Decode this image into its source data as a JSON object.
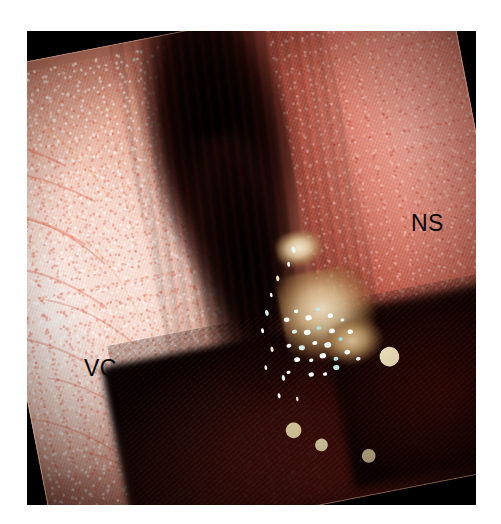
{
  "figure": {
    "type": "endoscopic-photograph",
    "modality": "nasal endoscopy",
    "background_color": "#ffffff",
    "frame_color": "#000000",
    "frame": {
      "x": 27,
      "y": 31,
      "width": 449,
      "height": 474
    },
    "photo_rotation_degrees": -11
  },
  "annotations": [
    {
      "id": "ns",
      "label": "NS",
      "meaning": "nasal septum",
      "color": "#080808",
      "font_size_px": 23,
      "x": 411,
      "y": 212
    },
    {
      "id": "vc",
      "label": "VC",
      "meaning": "vocal cord",
      "color": "#080808",
      "font_size_px": 23,
      "x": 84,
      "y": 357
    }
  ],
  "regions": [
    {
      "name": "pale-mucosa-left",
      "description": "pale pink and white mottled mucosal surface occupying the left half of the field",
      "dominant_colors": [
        "#fdf6f0",
        "#f2cdbd",
        "#d88c74",
        "#e74c36"
      ]
    },
    {
      "name": "pink-mucosa-right",
      "description": "pink-red mucosal wall on the right side of the field",
      "dominant_colors": [
        "#f0ae9e",
        "#d9806c",
        "#b3553f",
        "#8c2f22"
      ]
    },
    {
      "name": "dark-airway-center",
      "description": "dark central passage between the two mucosal walls",
      "dominant_colors": [
        "#000000",
        "#190604",
        "#3c0f0b"
      ]
    },
    {
      "name": "lesion-center-lower",
      "description": "tan and pale-yellow nodular lesion on the lower central wall",
      "dominant_colors": [
        "#f0e2c4",
        "#d6ba8c",
        "#a87c4a"
      ]
    },
    {
      "name": "specular-speckles",
      "description": "cluster of bright white and cyan specular highlights over the lesion",
      "dominant_colors": [
        "#ffffff",
        "#d9f2f2",
        "#8fd4d4"
      ]
    },
    {
      "name": "dark-maroon-inferior",
      "description": "deep maroon shadowed tissue across the lower portion of the field",
      "dominant_colors": [
        "#5c140e",
        "#3a0c09",
        "#180504"
      ]
    }
  ],
  "speckles": {
    "cluster": [
      {
        "x": 14,
        "y": 30,
        "r": 2.1,
        "c": "#ffffff"
      },
      {
        "x": 22,
        "y": 24,
        "r": 1.7,
        "c": "#e6f7f7"
      },
      {
        "x": 30,
        "y": 32,
        "r": 2.4,
        "c": "#ffffff"
      },
      {
        "x": 38,
        "y": 26,
        "r": 1.6,
        "c": "#bfe8e8"
      },
      {
        "x": 46,
        "y": 34,
        "r": 2.0,
        "c": "#ffffff"
      },
      {
        "x": 18,
        "y": 42,
        "r": 1.9,
        "c": "#d6f0f0"
      },
      {
        "x": 27,
        "y": 45,
        "r": 2.5,
        "c": "#ffffff"
      },
      {
        "x": 36,
        "y": 43,
        "r": 1.8,
        "c": "#a8dede"
      },
      {
        "x": 45,
        "y": 48,
        "r": 2.2,
        "c": "#ffffff"
      },
      {
        "x": 54,
        "y": 40,
        "r": 1.5,
        "c": "#e2f5f5"
      },
      {
        "x": 12,
        "y": 54,
        "r": 1.8,
        "c": "#ffffff"
      },
      {
        "x": 21,
        "y": 58,
        "r": 2.3,
        "c": "#cfeeee"
      },
      {
        "x": 31,
        "y": 56,
        "r": 1.9,
        "c": "#ffffff"
      },
      {
        "x": 40,
        "y": 60,
        "r": 2.6,
        "c": "#f2fbfb"
      },
      {
        "x": 50,
        "y": 57,
        "r": 1.7,
        "c": "#9ed8d8"
      },
      {
        "x": 58,
        "y": 52,
        "r": 2.0,
        "c": "#ffffff"
      },
      {
        "x": 16,
        "y": 68,
        "r": 2.2,
        "c": "#ffffff"
      },
      {
        "x": 26,
        "y": 71,
        "r": 1.6,
        "c": "#dff4f4"
      },
      {
        "x": 35,
        "y": 69,
        "r": 2.4,
        "c": "#ffffff"
      },
      {
        "x": 44,
        "y": 74,
        "r": 1.8,
        "c": "#b5e3e3"
      },
      {
        "x": 53,
        "y": 70,
        "r": 2.1,
        "c": "#ffffff"
      },
      {
        "x": 24,
        "y": 84,
        "r": 2.0,
        "c": "#f6fcfc"
      },
      {
        "x": 34,
        "y": 86,
        "r": 1.6,
        "c": "#ffffff"
      },
      {
        "x": 43,
        "y": 82,
        "r": 2.3,
        "c": "#c8eaea"
      },
      {
        "x": 8,
        "y": 78,
        "r": 1.5,
        "c": "#ffffff"
      },
      {
        "x": 60,
        "y": 78,
        "r": 1.7,
        "c": "#eaf8f8"
      }
    ],
    "trail": [
      {
        "x": 62,
        "y": 6,
        "r": 2.0,
        "c": "#e8f6f6"
      },
      {
        "x": 54,
        "y": 14,
        "r": 1.5,
        "c": "#ffffff"
      },
      {
        "x": 40,
        "y": 21,
        "r": 1.7,
        "c": "#f0e4c0"
      },
      {
        "x": 30,
        "y": 30,
        "r": 1.4,
        "c": "#ffffff"
      },
      {
        "x": 22,
        "y": 40,
        "r": 1.8,
        "c": "#dff0f0"
      },
      {
        "x": 14,
        "y": 50,
        "r": 1.5,
        "c": "#ffffff"
      },
      {
        "x": 20,
        "y": 62,
        "r": 1.6,
        "c": "#f2e8c8"
      },
      {
        "x": 10,
        "y": 72,
        "r": 1.4,
        "c": "#ffffff"
      },
      {
        "x": 26,
        "y": 80,
        "r": 1.7,
        "c": "#e0f2f2"
      },
      {
        "x": 18,
        "y": 90,
        "r": 1.5,
        "c": "#ffffff"
      },
      {
        "x": 36,
        "y": 94,
        "r": 1.3,
        "c": "#f4eccc"
      }
    ],
    "isolated": [
      {
        "x": 74,
        "y": 73,
        "r": 2.0,
        "c": "#f7e9c2"
      },
      {
        "x": 52,
        "y": 84,
        "r": 1.6,
        "c": "#e8d9a8"
      },
      {
        "x": 57,
        "y": 88,
        "r": 1.3,
        "c": "#f2e4b8"
      },
      {
        "x": 66,
        "y": 92,
        "r": 1.4,
        "c": "#ddc99a"
      }
    ]
  },
  "vessels": [
    {
      "d": "M 18 58 C 48 66, 76 82, 104 104",
      "w": 2.4,
      "c": "#e04a2e",
      "o": 0.62
    },
    {
      "d": "M 34 96 C 66 104, 96 122, 126 146",
      "w": 2.0,
      "c": "#d6472d",
      "o": 0.52
    },
    {
      "d": "M 10 132 C 44 140, 78 160, 108 188",
      "w": 2.6,
      "c": "#e8562f",
      "o": 0.58
    },
    {
      "d": "M 52 150 C 80 162, 104 184, 124 212",
      "w": 1.8,
      "c": "#cf4026",
      "o": 0.48
    },
    {
      "d": "M 22 196 C 56 204, 88 226, 116 256",
      "w": 2.2,
      "c": "#e25230",
      "o": 0.54
    },
    {
      "d": "M 60 238 C 90 250, 116 272, 138 300",
      "w": 1.9,
      "c": "#d44a2c",
      "o": 0.46
    },
    {
      "d": "M 14 268 C 48 278, 80 300, 106 330",
      "w": 2.3,
      "c": "#e05030",
      "o": 0.5
    },
    {
      "d": "M 46 318 C 78 330, 104 352, 126 380",
      "w": 1.8,
      "c": "#cc4426",
      "o": 0.44
    },
    {
      "d": "M 20 356 C 54 368, 86 392, 112 420",
      "w": 2.1,
      "c": "#de4e2e",
      "o": 0.48
    },
    {
      "d": "M 66 400 C 94 412, 118 432, 138 456",
      "w": 1.7,
      "c": "#d0461f",
      "o": 0.42
    },
    {
      "d": "M 90 60 C 112 84, 128 112, 140 142",
      "w": 1.6,
      "c": "#f0a23a",
      "o": 0.4
    },
    {
      "d": "M 118 196 C 134 222, 144 250, 150 280",
      "w": 1.5,
      "c": "#eb9a34",
      "o": 0.36
    }
  ]
}
